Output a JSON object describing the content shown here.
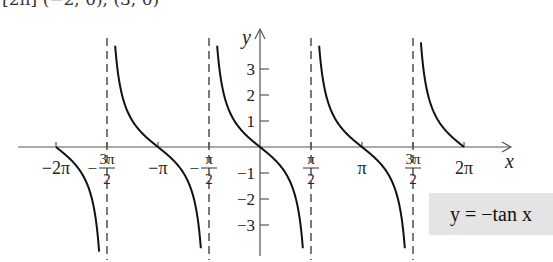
{
  "clipped_header": "[2π] (−2, 0), (3, 0)",
  "legend": {
    "text": "y = −tan x",
    "background": "#e4e4e4"
  },
  "chart_data": {
    "type": "line",
    "title": "",
    "function": "y = -tan x",
    "xlabel": "x",
    "ylabel": "y",
    "x_tick_labels": [
      "−2π",
      "−3π/2",
      "−π",
      "−π/2",
      "π/2",
      "π",
      "3π/2",
      "2π"
    ],
    "x_tick_values": [
      -6.2832,
      -4.7124,
      -3.1416,
      -1.5708,
      1.5708,
      3.1416,
      4.7124,
      6.2832
    ],
    "y_tick_labels": [
      "3",
      "2",
      "1",
      "−1",
      "−2",
      "−3"
    ],
    "y_tick_values": [
      3,
      2,
      1,
      -1,
      -2,
      -3
    ],
    "asymptotes_x": [
      "−3π/2",
      "−π/2",
      "π/2",
      "3π/2"
    ],
    "x_range": [
      -6.2832,
      6.2832
    ],
    "ylim": [
      -4,
      4
    ],
    "grid": false,
    "series": [
      {
        "name": "-tan x",
        "zeros": [
          "−2π",
          "−π",
          "0",
          "π",
          "2π"
        ]
      }
    ]
  },
  "geometry": {
    "origin_x": 260,
    "origin_y": 147,
    "half_pi_px": 51,
    "unit_y_px": 26
  }
}
